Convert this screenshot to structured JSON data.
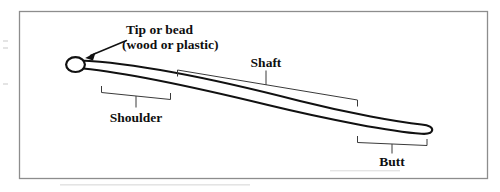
{
  "figure": {
    "kind": "labeled-diagram",
    "background_color": "#ffffff",
    "frame_color": "#8d8d8d",
    "ink_color": "#111111",
    "bracket_color": "#3a3a3a"
  },
  "labels": {
    "tip": {
      "line1": "Tip or bead",
      "line2": "(wood or plastic)"
    },
    "shaft": "Shaft",
    "shoulder": "Shoulder",
    "butt": "Butt"
  },
  "parts": [
    {
      "name": "tip-or-bead",
      "label": "Tip or bead",
      "note": "(wood or plastic)",
      "callout": "arrow"
    },
    {
      "name": "shoulder",
      "label": "Shoulder",
      "callout": "bracket-below"
    },
    {
      "name": "shaft",
      "label": "Shaft",
      "callout": "bracket-above"
    },
    {
      "name": "butt",
      "label": "Butt",
      "callout": "bracket-below"
    }
  ],
  "icons": {
    "arrow": "arrow-callout-icon",
    "bracket": "span-bracket-icon"
  }
}
